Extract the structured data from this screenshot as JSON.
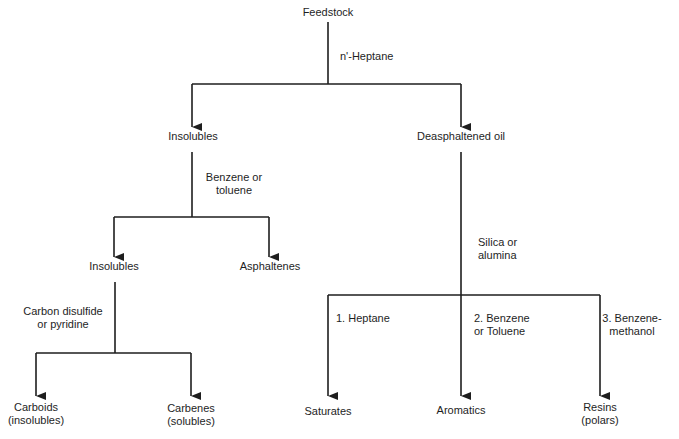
{
  "diagram": {
    "type": "flowchart-tree",
    "nodes": {
      "feedstock": "Feedstock",
      "insolubles_1": "Insolubles",
      "deasphaltened_oil": "Deasphaltened oil",
      "insolubles_2": "Insolubles",
      "asphaltenes": "Asphaltenes",
      "carboids": [
        "Carboids",
        "(insolubles)"
      ],
      "carbenes": [
        "Carbenes",
        "(solubles)"
      ],
      "saturates": "Saturates",
      "aromatics": "Aromatics",
      "resins": [
        "Resins",
        "(polars)"
      ]
    },
    "edges": {
      "n_heptane": "n'-Heptane",
      "benzene_toluene": [
        "Benzene or",
        "toluene"
      ],
      "carbon_disulfide": [
        "Carbon disulfide",
        "or pyridine"
      ],
      "silica_alumina": [
        "Silica or",
        "alumina"
      ],
      "heptane_1": "1. Heptane",
      "benzene_toluene_2": [
        "2. Benzene",
        "or Toluene"
      ],
      "benzene_methanol_3": [
        "3. Benzene-",
        "methanol"
      ]
    },
    "colors": {
      "line": "#1e1e1e",
      "text": "#1e1e1e",
      "background": "#ffffff"
    }
  }
}
